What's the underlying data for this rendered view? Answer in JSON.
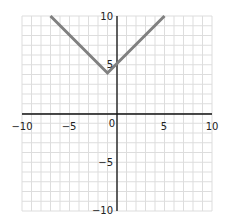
{
  "chart_data": {
    "type": "line",
    "title": "",
    "xlabel": "",
    "ylabel": "",
    "xlim": [
      -10,
      10
    ],
    "ylim": [
      -10,
      10
    ],
    "grid": true,
    "function": "y = |x + 1| + 4",
    "series": [
      {
        "name": "absolute value",
        "x": [
          -7,
          -1,
          5
        ],
        "y": [
          10,
          4,
          10
        ],
        "color": "#808080"
      }
    ],
    "x_ticks": [
      "-10",
      "-5",
      "0",
      "5",
      "10"
    ],
    "y_ticks": [
      "10",
      "5",
      "-5",
      "-10"
    ]
  },
  "labels": {
    "x_neg10": "−10",
    "x_neg5": "−5",
    "x_0": "0",
    "x_5": "5",
    "x_10": "10",
    "y_10": "10",
    "y_5": "5",
    "y_neg5": "−5",
    "y_neg10": "−10"
  }
}
